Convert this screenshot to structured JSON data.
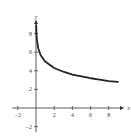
{
  "chart_data": {
    "type": "line",
    "title": "",
    "xlabel": "x",
    "ylabel": "y",
    "xlim": [
      -2.6,
      9.6
    ],
    "ylim": [
      -2.6,
      9.4
    ],
    "grid": false,
    "x_ticks": [
      -2,
      2,
      4,
      6,
      8
    ],
    "y_ticks": [
      -2,
      2,
      4,
      6,
      8
    ],
    "x_tick_labels": [
      "−2",
      "2",
      "4",
      "6",
      "8"
    ],
    "y_tick_labels": [
      "−2",
      "2",
      "4",
      "6",
      "8"
    ],
    "series": [
      {
        "name": "curve",
        "x": [
          0.02,
          0.05,
          0.1,
          0.25,
          0.5,
          1,
          2,
          3,
          4,
          5,
          6,
          7,
          8,
          9
        ],
        "values": [
          8.9,
          8.0,
          7.3,
          6.4,
          5.7,
          5.0,
          4.3,
          3.9,
          3.6,
          3.4,
          3.2,
          3.05,
          2.9,
          2.8
        ]
      }
    ],
    "color": "#222222"
  }
}
